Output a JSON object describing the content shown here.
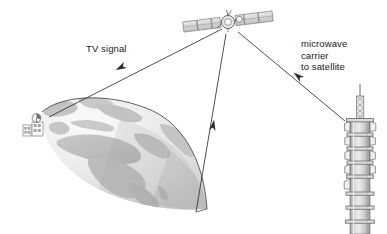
{
  "diagram": {
    "background_color": "#ffffff",
    "labels": {
      "tv_signal": "TV signal",
      "microwave_line1": "microwave",
      "microwave_line2": "carrier",
      "microwave_line3": "to satellite"
    },
    "objects": {
      "satellite": {
        "name": "communications satellite",
        "position": [
          228,
          22
        ],
        "solar_panel_segments_per_wing": 3
      },
      "earth": {
        "name": "earth globe partial view",
        "continents_visible": "Europe, Africa, Middle East",
        "fill_color": "#e9e9e9",
        "land_color": "#c6c6c6",
        "outline_color": "#4a4a4a"
      },
      "ground_station": {
        "name": "ground receiving station with dish antenna",
        "position": [
          30,
          122
        ]
      },
      "tower": {
        "name": "microwave relay tower",
        "position": [
          358,
          210
        ],
        "dish_count": 8,
        "fill_color": "#d2d2d2"
      }
    },
    "links": [
      {
        "id": "downlink-tv",
        "from": "satellite",
        "to": "earth",
        "arrow_direction": "toward earth",
        "label": "TV signal"
      },
      {
        "id": "uplink-center",
        "from": "earth",
        "to": "satellite",
        "arrow_direction": "toward satellite",
        "label": ""
      },
      {
        "id": "uplink-microwave",
        "from": "tower",
        "to": "satellite",
        "arrow_direction": "toward satellite",
        "label": "microwave carrier to satellite"
      }
    ],
    "colors": {
      "line": "#333333",
      "text": "#1a1a1a",
      "globe_light": "#f2f2f2",
      "globe_mid": "#dcdcdc",
      "globe_dark": "#bdbdbd",
      "metal_light": "#eaeaea",
      "metal_mid": "#c9c9c9",
      "metal_dark": "#8f8f8f"
    }
  }
}
